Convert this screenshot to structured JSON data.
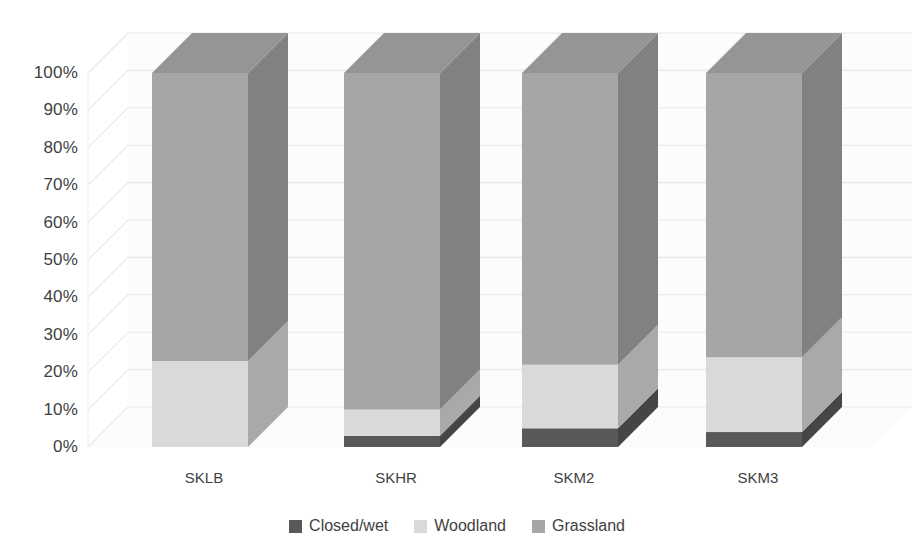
{
  "chart_data": {
    "type": "bar",
    "subtype": "100%-stacked-column-3d",
    "title": "",
    "xlabel": "",
    "ylabel": "",
    "categories": [
      "SKLB",
      "SKHR",
      "SKM2",
      "SKM3"
    ],
    "series": [
      {
        "name": "Closed/wet",
        "color": "#595959",
        "values": [
          0,
          3,
          5,
          4
        ]
      },
      {
        "name": "Woodland",
        "color": "#d9d9d9",
        "values": [
          23,
          7,
          17,
          20
        ]
      },
      {
        "name": "Grassland",
        "color": "#a6a6a6",
        "values": [
          77,
          90,
          78,
          76
        ]
      }
    ],
    "stack_order": [
      "Closed/wet",
      "Woodland",
      "Grassland"
    ],
    "ylim": [
      0,
      100
    ],
    "ytick_values": [
      0,
      10,
      20,
      30,
      40,
      50,
      60,
      70,
      80,
      90,
      100
    ],
    "ytick_labels": [
      "0%",
      "10%",
      "20%",
      "30%",
      "40%",
      "50%",
      "60%",
      "70%",
      "80%",
      "90%",
      "100%"
    ],
    "grid": true,
    "grid_axis": "y",
    "grid_color": "#e8e8e8",
    "legend_position": "bottom",
    "background": "#ffffff"
  },
  "axis": {
    "y": {
      "ticks": [
        {
          "label": "100%",
          "value": 100
        },
        {
          "label": "90%",
          "value": 90
        },
        {
          "label": "80%",
          "value": 80
        },
        {
          "label": "70%",
          "value": 70
        },
        {
          "label": "60%",
          "value": 60
        },
        {
          "label": "50%",
          "value": 50
        },
        {
          "label": "40%",
          "value": 40
        },
        {
          "label": "30%",
          "value": 30
        },
        {
          "label": "20%",
          "value": 20
        },
        {
          "label": "10%",
          "value": 10
        },
        {
          "label": "0%",
          "value": 0
        }
      ]
    },
    "x": {
      "ticks": [
        {
          "label": "SKLB"
        },
        {
          "label": "SKHR"
        },
        {
          "label": "SKM2"
        },
        {
          "label": "SKM3"
        }
      ]
    }
  },
  "legend": {
    "items": [
      {
        "label": "Closed/wet",
        "color": "#595959"
      },
      {
        "label": "Woodland",
        "color": "#d9d9d9"
      },
      {
        "label": "Grassland",
        "color": "#a6a6a6"
      }
    ]
  }
}
